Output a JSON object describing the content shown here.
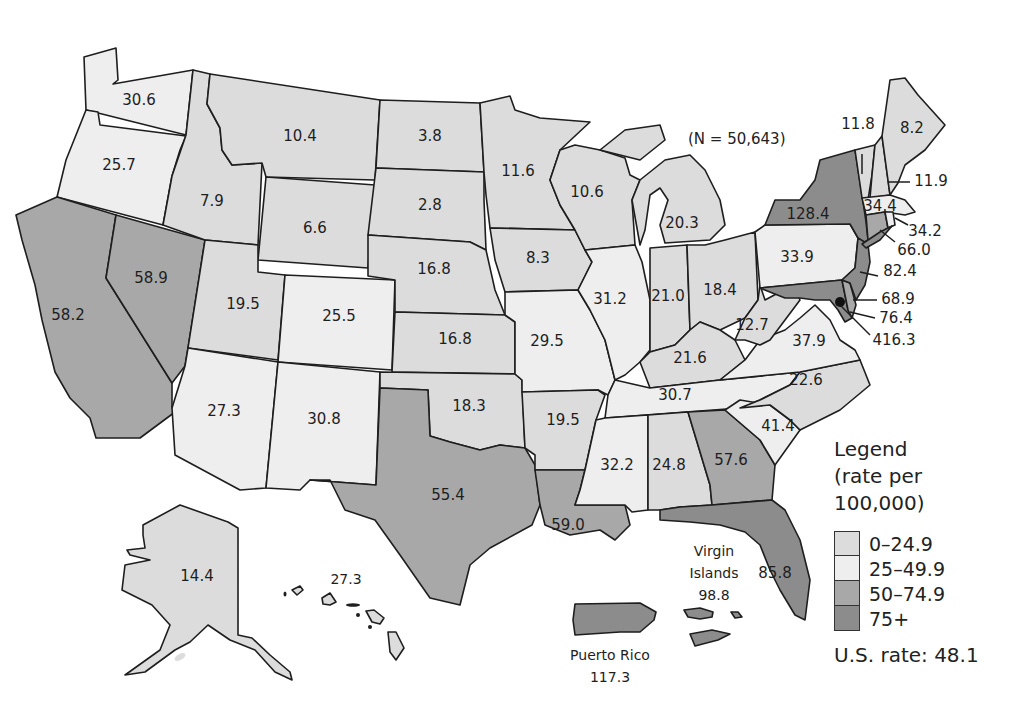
{
  "map": {
    "title": "",
    "note": "(N = 50,643)",
    "colors": {
      "c0": "#dcdcdc",
      "c1": "#eeeeee",
      "c2": "#a8a8a8",
      "c3": "#8c8c8c"
    },
    "legend": {
      "title_line1": "Legend",
      "title_line2": "(rate per",
      "title_line3": "100,000)",
      "items": [
        {
          "label": "0–24.9",
          "color": "#dcdcdc"
        },
        {
          "label": "25–49.9",
          "color": "#eeeeee"
        },
        {
          "label": "50–74.9",
          "color": "#a8a8a8"
        },
        {
          "label": "75+",
          "color": "#8c8c8c"
        }
      ],
      "us_rate": "U.S. rate: 48.1"
    },
    "regions": {
      "WA": "30.6",
      "OR": "25.7",
      "CA": "58.2",
      "NV": "58.9",
      "ID": "7.9",
      "MT": "10.4",
      "WY": "6.6",
      "UT": "19.5",
      "AZ": "27.3",
      "CO": "25.5",
      "NM": "30.8",
      "ND": "3.8",
      "SD": "2.8",
      "NE": "16.8",
      "KS": "16.8",
      "OK": "18.3",
      "TX": "55.4",
      "MN": "11.6",
      "IA": "8.3",
      "MO": "29.5",
      "AR": "19.5",
      "LA": "59.0",
      "WI": "10.6",
      "IL": "31.2",
      "MI": "20.3",
      "IN": "21.0",
      "OH": "18.4",
      "KY": "21.6",
      "TN": "30.7",
      "MS": "32.2",
      "AL": "24.8",
      "GA": "57.6",
      "FL": "85.8",
      "SC": "41.4",
      "NC": "22.6",
      "VA": "37.9",
      "WV": "12.7",
      "PA": "33.9",
      "NY": "128.4",
      "VT": "11.8",
      "NH": "11.9",
      "ME": "8.2",
      "MA": "34.4",
      "RI": "34.2",
      "CT": "66.0",
      "NJ": "82.4",
      "DE": "68.9",
      "MD": "76.4",
      "DC": "416.3",
      "AK": "14.4",
      "HI": "27.3"
    },
    "territories": {
      "pr_name": "Puerto Rico",
      "pr_value": "117.3",
      "vi_name_1": "Virgin",
      "vi_name_2": "Islands",
      "vi_value": "98.8"
    }
  }
}
